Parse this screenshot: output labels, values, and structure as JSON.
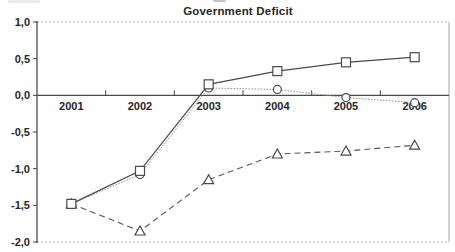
{
  "chart_data": {
    "type": "line",
    "title": "Government Deficit",
    "categories": [
      "2001",
      "2002",
      "2003",
      "2004",
      "2005",
      "2006"
    ],
    "series": [
      {
        "name": "square-series",
        "marker": "square",
        "line": "solid",
        "values": [
          -1.48,
          -1.03,
          0.15,
          0.33,
          0.45,
          0.52
        ]
      },
      {
        "name": "circle-series",
        "marker": "circle",
        "line": "dotted-thin",
        "values": [
          -1.48,
          -1.08,
          0.1,
          0.08,
          -0.03,
          -0.1
        ]
      },
      {
        "name": "triangle-series",
        "marker": "triangle",
        "line": "dashed",
        "values": [
          -1.48,
          -1.85,
          -1.15,
          -0.8,
          -0.76,
          -0.68
        ]
      }
    ],
    "ylim": [
      -2.0,
      1.0
    ],
    "ytick_values": [
      1.0,
      0.5,
      0.0,
      -0.5,
      -1.0,
      -1.5,
      -2.0
    ],
    "ytick_labels": [
      "1,0",
      "0,5",
      "0,0",
      "-0,5",
      "-1,0",
      "-1,5",
      "-2,0"
    ],
    "xlabel": "",
    "ylabel": "",
    "legend": "none",
    "grid": "dotted top and bottom borders, solid zero axis, light right border",
    "decimal_separator": ","
  },
  "colors": {
    "line": "#4a4a4a",
    "marker_fill": "#ffffff",
    "marker_stroke": "#4a4a4a",
    "border_dotted": "#b5b5b5",
    "text": "#262626",
    "background": "#ffffff"
  }
}
